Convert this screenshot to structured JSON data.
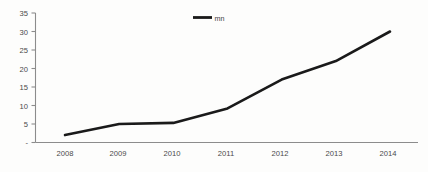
{
  "chart_data": {
    "type": "line",
    "title": "",
    "subtitle": "",
    "xlabel": "",
    "ylabel": "",
    "categories": [
      "2008",
      "2009",
      "2010",
      "2011",
      "2012",
      "2013",
      "2014"
    ],
    "x": [
      2008,
      2009,
      2010,
      2011,
      2012,
      2013,
      2014
    ],
    "series": [
      {
        "name": "mn",
        "color": "#1a1a1a",
        "values": [
          2,
          5,
          5.3,
          9.2,
          17,
          22,
          30
        ]
      }
    ],
    "ylim": [
      0,
      35
    ],
    "ytick_values": [
      0,
      5,
      10,
      15,
      20,
      25,
      30,
      35
    ],
    "ytick_labels": [
      "-",
      "5",
      "10",
      "15",
      "20",
      "25",
      "30",
      "35"
    ],
    "xtick_labels": [
      "2008",
      "2009",
      "2010",
      "2011",
      "2012",
      "2013",
      "2014"
    ],
    "grid": false,
    "markers": false,
    "legend": {
      "position": "top-center",
      "entries": [
        {
          "label": "mn",
          "color": "#1a1a1a",
          "marker": "line"
        }
      ]
    },
    "axis_color": "#8c8c8c",
    "background_color": "#fdfdfc",
    "text_color": "#4a4a4a"
  }
}
